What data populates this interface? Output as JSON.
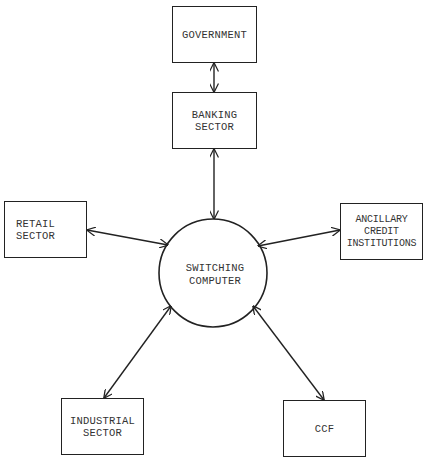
{
  "diagram": {
    "center": {
      "id": "switching",
      "label": "SWITCHING\nCOMPUTER",
      "shape": "circle"
    },
    "nodes": [
      {
        "id": "government",
        "label": "GOVERNMENT"
      },
      {
        "id": "banking",
        "label": "BANKING\nSECTOR"
      },
      {
        "id": "retail",
        "label": "RETAIL\nSECTOR"
      },
      {
        "id": "ancillary",
        "label": "ANCILLARY\nCREDIT\nINSTITUTIONS"
      },
      {
        "id": "industrial",
        "label": "INDUSTRIAL\nSECTOR"
      },
      {
        "id": "ccf",
        "label": "CCF"
      }
    ],
    "edges": [
      {
        "from": "government",
        "to": "banking",
        "type": "bidirectional"
      },
      {
        "from": "banking",
        "to": "switching",
        "type": "bidirectional"
      },
      {
        "from": "retail",
        "to": "switching",
        "type": "bidirectional"
      },
      {
        "from": "ancillary",
        "to": "switching",
        "type": "bidirectional"
      },
      {
        "from": "industrial",
        "to": "switching",
        "type": "bidirectional"
      },
      {
        "from": "ccf",
        "to": "switching",
        "type": "bidirectional"
      }
    ]
  }
}
